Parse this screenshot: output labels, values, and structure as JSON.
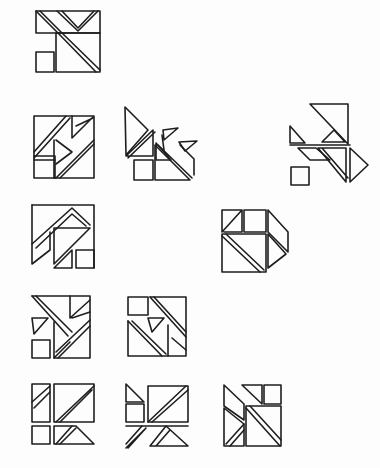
{
  "sheet": {
    "description": "Hand-drawn sketch of tangram-style square dissection figures",
    "ink_color": "#1e1e1e",
    "paper_color": "#fdfdfd",
    "figure_count": 12
  },
  "figures": [
    {
      "id": "fig-1",
      "row": 1,
      "kind": "square-dissection"
    },
    {
      "id": "fig-2",
      "row": 2,
      "kind": "square-dissection"
    },
    {
      "id": "fig-3",
      "row": 2,
      "kind": "scattered-pieces"
    },
    {
      "id": "fig-4",
      "row": 2,
      "kind": "scattered-pieces"
    },
    {
      "id": "fig-5",
      "row": 3,
      "kind": "square-dissection"
    },
    {
      "id": "fig-6",
      "row": 3,
      "kind": "square-dissection"
    },
    {
      "id": "fig-7",
      "row": 4,
      "kind": "square-dissection"
    },
    {
      "id": "fig-8",
      "row": 4,
      "kind": "square-dissection"
    },
    {
      "id": "fig-9",
      "row": 5,
      "kind": "square-dissection"
    },
    {
      "id": "fig-10",
      "row": 5,
      "kind": "square-dissection"
    },
    {
      "id": "fig-11",
      "row": 5,
      "kind": "square-dissection"
    }
  ]
}
